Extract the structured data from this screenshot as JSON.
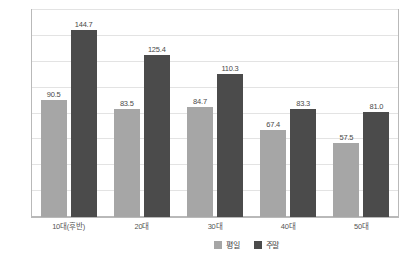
{
  "chart_data": {
    "type": "bar",
    "title": "",
    "subtitle": "",
    "xlabel": "",
    "ylabel": "",
    "ylim": [
      0,
      160
    ],
    "ytick_step": 20,
    "yticks": [
      0,
      20,
      40,
      60,
      80,
      100,
      120,
      140,
      160
    ],
    "grid": true,
    "legend_position": "bottom-right",
    "categories": [
      "10대(후반)",
      "20대",
      "30대",
      "40대",
      "50대"
    ],
    "series": [
      {
        "name": "평일",
        "color": "#a6a6a6",
        "values": [
          90.5,
          83.5,
          84.7,
          67.4,
          57.5
        ],
        "labels": [
          "90.5",
          "83.5",
          "84.7",
          "67.4",
          "57.5"
        ]
      },
      {
        "name": "주말",
        "color": "#4b4b4b",
        "values": [
          144.7,
          125.4,
          110.3,
          83.3,
          81.0
        ],
        "labels": [
          "144.7",
          "125.4",
          "110.3",
          "83.3",
          "81.0"
        ]
      }
    ]
  },
  "legend": {
    "items": [
      {
        "label": "평일",
        "color": "#a6a6a6"
      },
      {
        "label": "주말",
        "color": "#4b4b4b"
      }
    ]
  }
}
